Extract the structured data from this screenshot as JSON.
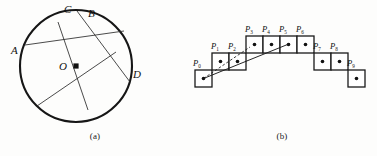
{
  "figure": {
    "panels": [
      {
        "id": "a",
        "caption": "(a)",
        "type": "circle-with-chords",
        "center_label": "O",
        "point_labels": [
          "A",
          "B",
          "C",
          "D"
        ],
        "labels": {
          "A": "A",
          "B": "B",
          "C": "C",
          "D": "D",
          "O": "O"
        }
      },
      {
        "id": "b",
        "caption": "(b)",
        "type": "staircase-of-cells",
        "cells": [
          {
            "label": "P",
            "sub": "0",
            "row": 2,
            "col": 0
          },
          {
            "label": "P",
            "sub": "1",
            "row": 1,
            "col": 1
          },
          {
            "label": "P",
            "sub": "2",
            "row": 1,
            "col": 2
          },
          {
            "label": "P",
            "sub": "3",
            "row": 0,
            "col": 3
          },
          {
            "label": "P",
            "sub": "4",
            "row": 0,
            "col": 4
          },
          {
            "label": "P",
            "sub": "5",
            "row": 0,
            "col": 5
          },
          {
            "label": "P",
            "sub": "6",
            "row": 0,
            "col": 6
          },
          {
            "label": "P",
            "sub": "7",
            "row": 1,
            "col": 7
          },
          {
            "label": "P",
            "sub": "8",
            "row": 1,
            "col": 8
          },
          {
            "label": "P",
            "sub": "9",
            "row": 2,
            "col": 9
          }
        ],
        "marker": "filled-dot"
      }
    ]
  },
  "colors": {
    "ink": "#111111",
    "stroke": "#1a1a1a",
    "paper": "#fdfdfc"
  }
}
